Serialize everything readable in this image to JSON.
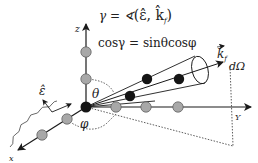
{
  "diagram": {
    "equations": {
      "gamma_def": "γ = ∢(ε̂, k̂f)",
      "gamma_lhs": "γ = ∢",
      "gamma_args": "(ε̂, k̂",
      "gamma_sub": "f",
      "gamma_close": ")",
      "cos_relation": "cosγ = sinθcosφ"
    },
    "axes": {
      "z_label": "z",
      "y_label": "Y",
      "x_label": "x"
    },
    "angles": {
      "theta": "θ",
      "phi": "φ"
    },
    "vectors": {
      "polarization": "ε̂",
      "wavevector": "k",
      "wavevector_sub": "f",
      "solid_angle": "dΩ"
    },
    "colors": {
      "line": "#1a1a1a",
      "atom_gray": "#a8a8a8",
      "atom_black": "#151515",
      "dash": "#333333"
    }
  }
}
